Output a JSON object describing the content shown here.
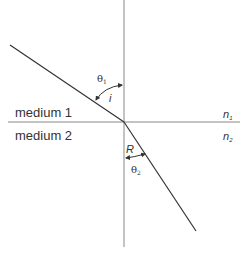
{
  "diagram": {
    "title": "",
    "type": "refraction-of-light",
    "labels": {
      "medium1": "medium 1",
      "medium2": "medium 2",
      "n1_base": "n",
      "n1_sub": "1",
      "n2_base": "n",
      "n2_sub": "2",
      "theta1_base": "θ",
      "theta1_sub": "1",
      "theta2_base": "θ",
      "theta2_sub": "2",
      "incidence_angle": "i",
      "refraction_angle": "R"
    },
    "colors": {
      "line": "#333333",
      "normal": "#888888",
      "text": "#333333"
    }
  }
}
